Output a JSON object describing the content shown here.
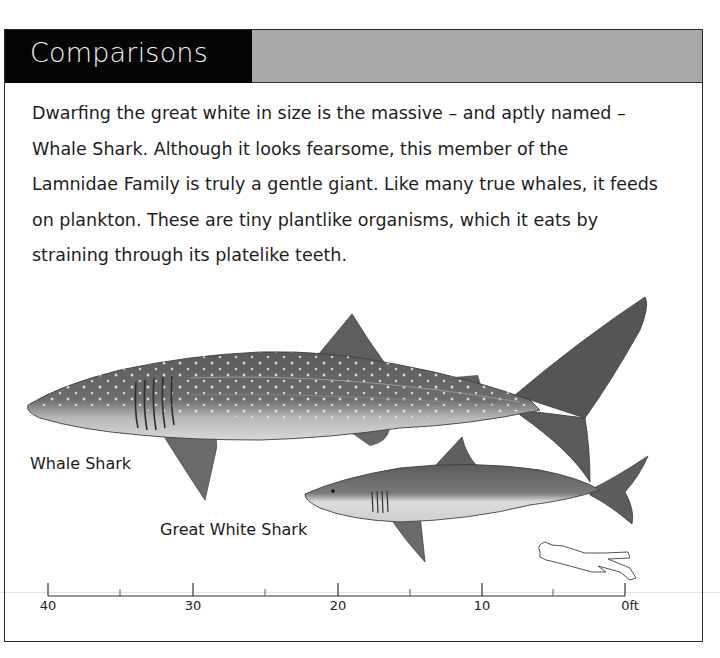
{
  "header": {
    "title": "Comparisons",
    "title_bg": "#050505",
    "band_color": "#a9a9a9"
  },
  "body": {
    "lines": [
      "Dwarfing the great white in size is the massive – and aptly named –",
      "Whale Shark. Although it looks fearsome, this member of the",
      "Lamnidae Family is truly a gentle giant. Like many true whales, it feeds",
      "on plankton. These are tiny plantlike organisms, which it eats by",
      "straining through its platelike teeth."
    ]
  },
  "illustration": {
    "whale_shark_label": "Whale Shark",
    "great_white_label": "Great White Shark",
    "diver_icon": "scuba-diver-outline-icon"
  },
  "scale": {
    "unit": "ft",
    "ticks": [
      {
        "label": "40",
        "x": 48
      },
      {
        "label": "30",
        "x": 193
      },
      {
        "label": "20",
        "x": 338
      },
      {
        "label": "10",
        "x": 482
      },
      {
        "label": "0ft",
        "x": 625
      }
    ],
    "minor_ticks_x": [
      120,
      265,
      410,
      553
    ]
  }
}
